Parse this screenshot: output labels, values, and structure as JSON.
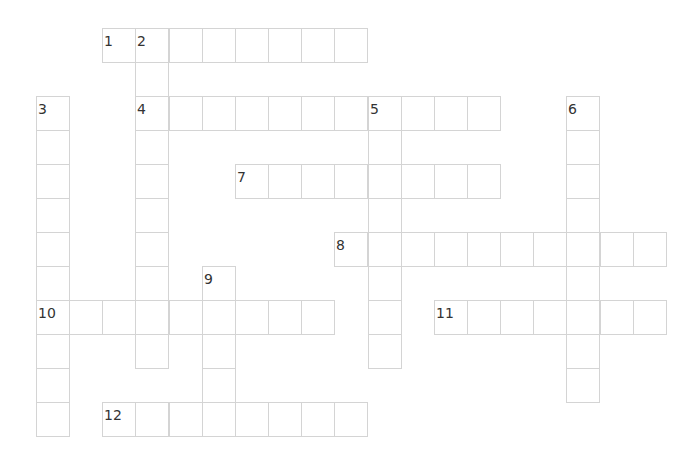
{
  "puzzle": {
    "type": "crossword",
    "grid": {
      "origin_x": 36,
      "origin_y": 28,
      "cell_w": 33.15,
      "cell_h": 34
    },
    "border_color": "#d4d4d4",
    "number_color": "#333333",
    "words": [
      {
        "number": "1",
        "direction": "across",
        "row": 0,
        "col": 2,
        "length": 8
      },
      {
        "number": "2",
        "direction": "down",
        "row": 0,
        "col": 3,
        "length": 10
      },
      {
        "number": "3",
        "direction": "down",
        "row": 2,
        "col": 0,
        "length": 10
      },
      {
        "number": "4",
        "direction": "across",
        "row": 2,
        "col": 3,
        "length": 11
      },
      {
        "number": "5",
        "direction": "down",
        "row": 2,
        "col": 10,
        "length": 8
      },
      {
        "number": "6",
        "direction": "down",
        "row": 2,
        "col": 16,
        "length": 9
      },
      {
        "number": "7",
        "direction": "across",
        "row": 4,
        "col": 6,
        "length": 8
      },
      {
        "number": "8",
        "direction": "across",
        "row": 6,
        "col": 9,
        "length": 10
      },
      {
        "number": "9",
        "direction": "down",
        "row": 7,
        "col": 5,
        "length": 5
      },
      {
        "number": "10",
        "direction": "across",
        "row": 8,
        "col": 0,
        "length": 9
      },
      {
        "number": "11",
        "direction": "across",
        "row": 8,
        "col": 12,
        "length": 7
      },
      {
        "number": "12",
        "direction": "across",
        "row": 11,
        "col": 2,
        "length": 8
      }
    ]
  }
}
